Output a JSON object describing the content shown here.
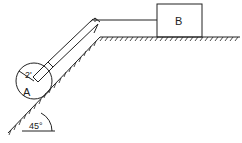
{
  "diagram": {
    "type": "mechanics-pulley-incline",
    "labels": {
      "block": "B",
      "cylinder": "A",
      "radius": "2'",
      "angle": "45°"
    },
    "colors": {
      "stroke": "#222222",
      "background": "#ffffff"
    },
    "elements": [
      {
        "id": "block-B",
        "kind": "rectangle",
        "label": "B"
      },
      {
        "id": "cylinder-A",
        "kind": "circle",
        "label": "A",
        "radius_label": "2'"
      },
      {
        "id": "incline",
        "kind": "inclined-plane",
        "angle_label": "45°"
      },
      {
        "id": "floor",
        "kind": "horizontal-surface"
      },
      {
        "id": "pulley",
        "kind": "pulley"
      },
      {
        "id": "rope",
        "kind": "cable",
        "connects": [
          "cylinder-A",
          "block-B"
        ]
      }
    ]
  }
}
